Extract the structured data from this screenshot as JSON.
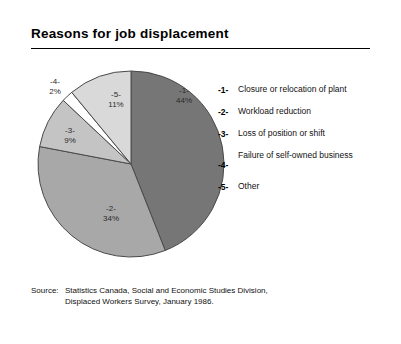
{
  "title": "Reasons for job displacement",
  "legend": [
    {
      "key": "-1-",
      "text": "Closure or relocation of plant",
      "two_line": true
    },
    {
      "key": "-2-",
      "text": "Workload reduction",
      "two_line": false
    },
    {
      "key": "-3-",
      "text": "Loss of position or shift",
      "two_line": false
    },
    {
      "key": "-4-",
      "text": "Failure of self-owned business",
      "two_line": true
    },
    {
      "key": "-5-",
      "text": "Other",
      "two_line": false
    }
  ],
  "slice_labels": [
    {
      "num": "-1-",
      "pct": "44%"
    },
    {
      "num": "-2-",
      "pct": "34%"
    },
    {
      "num": "-3-",
      "pct": "9%"
    },
    {
      "num": "-4-",
      "pct": "2%"
    },
    {
      "num": "-5-",
      "pct": "11%"
    }
  ],
  "source": {
    "label": "Source:",
    "line1": "Statistics Canada, Social and Economic Studies Division,",
    "line2": "Displaced Workers Survey, January 1986."
  },
  "chart_data": {
    "type": "pie",
    "title": "Reasons for job displacement",
    "categories": [
      "Closure or relocation of plant",
      "Workload reduction",
      "Loss of position or shift",
      "Failure of self-owned business",
      "Other"
    ],
    "keys": [
      "-1-",
      "-2-",
      "-3-",
      "-4-",
      "-5-"
    ],
    "values": [
      44,
      34,
      9,
      2,
      11
    ],
    "unit": "percent",
    "value_labels": [
      "44%",
      "34%",
      "9%",
      "2%",
      "11%"
    ],
    "colors": [
      "#767676",
      "#a8a8a8",
      "#c4c4c4",
      "#ffffff",
      "#d9d9d9"
    ],
    "slice_outline": "#4a4a4a",
    "start_angle_deg": 0,
    "direction": "clockwise",
    "legend_position": "right",
    "grid": false
  }
}
